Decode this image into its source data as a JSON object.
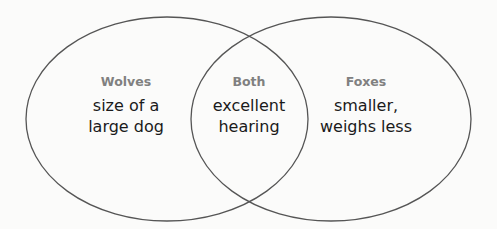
{
  "diagram": {
    "type": "venn",
    "colors": {
      "background": "#fbfbfa",
      "outline": "#555555",
      "title": "#808080",
      "body": "#1a1a1a"
    },
    "sets": [
      {
        "id": "left",
        "label": "Wolves",
        "cx": 167,
        "cy": 119,
        "rx": 141,
        "ry": 102
      },
      {
        "id": "right",
        "label": "Foxes",
        "cx": 331,
        "cy": 119,
        "rx": 140,
        "ry": 102
      }
    ],
    "regions": {
      "wolves": {
        "title": "Wolves",
        "body": "size of a\nlarge dog"
      },
      "both": {
        "title": "Both",
        "body": "excellent\nhearing"
      },
      "foxes": {
        "title": "Foxes",
        "body": "smaller,\nweighs less"
      }
    }
  }
}
